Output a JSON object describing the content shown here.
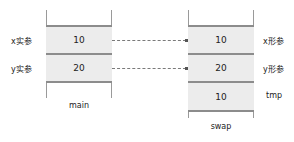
{
  "frames": {
    "main": {
      "title": "main",
      "cells": [
        {
          "label": "x实参",
          "value": "10"
        },
        {
          "label": "y实参",
          "value": "20"
        }
      ]
    },
    "swap": {
      "title": "swap",
      "cells": [
        {
          "label": "x形参",
          "value": "10"
        },
        {
          "label": "y形参",
          "value": "20"
        },
        {
          "label": "tmp",
          "value": "10"
        }
      ]
    }
  },
  "arrows": [
    {
      "from": "main.x实参",
      "to": "swap.x形参",
      "style": "dashed"
    },
    {
      "from": "main.y实参",
      "to": "swap.y形参",
      "style": "dashed"
    }
  ],
  "colors": {
    "cell_fill": "#ececec",
    "cell_border": "#8c8c8c",
    "stack_line": "#9a9a9a",
    "arrow": "#7a7a7a"
  }
}
